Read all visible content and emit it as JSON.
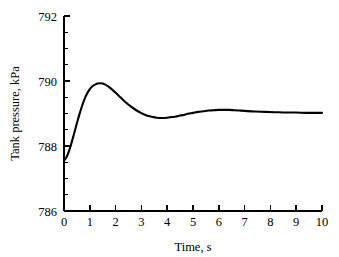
{
  "chart_data": {
    "type": "line",
    "title": "",
    "subtitle": "",
    "xlabel": "Time, s",
    "ylabel": "Tank pressure, kPa",
    "xlim": [
      0,
      10
    ],
    "ylim": [
      786,
      792
    ],
    "xticks": [
      0,
      1,
      2,
      3,
      4,
      5,
      6,
      7,
      8,
      9,
      10
    ],
    "xtick_labels": [
      "0",
      "1",
      "2",
      "3",
      "4",
      "5",
      "6",
      "7",
      "8",
      "9",
      "10"
    ],
    "yticks": [
      786,
      788,
      790,
      792
    ],
    "ytick_labels": [
      "786",
      "788",
      "790",
      "792"
    ],
    "y_minor_ticks": [
      786.5,
      787,
      787.5,
      788.5,
      789,
      789.5,
      790.5,
      791,
      791.5
    ],
    "grid": false,
    "legend": null,
    "legend_position": "none",
    "line_color": "#000000",
    "annotations": [],
    "series": [
      {
        "name": "Tank pressure",
        "x": [
          0.0,
          0.1,
          0.2,
          0.3,
          0.4,
          0.5,
          0.6,
          0.7,
          0.8,
          0.9,
          1.0,
          1.1,
          1.2,
          1.3,
          1.4,
          1.5,
          1.6,
          1.7,
          1.8,
          1.9,
          2.0,
          2.2,
          2.4,
          2.6,
          2.8,
          3.0,
          3.2,
          3.4,
          3.6,
          3.8,
          4.0,
          4.2,
          4.4,
          4.6,
          4.8,
          5.0,
          5.2,
          5.4,
          5.6,
          5.8,
          6.0,
          6.2,
          6.4,
          6.6,
          6.8,
          7.0,
          7.4,
          7.8,
          8.2,
          8.6,
          9.0,
          9.4,
          9.8,
          10.0
        ],
        "y": [
          787.55,
          787.66,
          787.86,
          788.12,
          788.41,
          788.7,
          788.98,
          789.23,
          789.45,
          789.62,
          789.75,
          789.84,
          789.89,
          789.92,
          789.93,
          789.92,
          789.89,
          789.84,
          789.78,
          789.71,
          789.64,
          789.49,
          789.34,
          789.21,
          789.1,
          789.01,
          788.94,
          788.9,
          788.87,
          788.86,
          788.87,
          788.89,
          788.92,
          788.95,
          788.99,
          789.02,
          789.05,
          789.07,
          789.09,
          789.1,
          789.11,
          789.11,
          789.11,
          789.1,
          789.09,
          789.08,
          789.06,
          789.05,
          789.04,
          789.03,
          789.03,
          789.02,
          789.02,
          789.02
        ]
      }
    ],
    "key_points": {
      "initial_value": 787.55,
      "peak_value": 789.93,
      "peak_time": 1.4,
      "undershoot_value": 788.86,
      "undershoot_time": 3.8,
      "second_peak_value": 789.11,
      "second_peak_time": 6.2,
      "steady_state": 789.02
    }
  }
}
